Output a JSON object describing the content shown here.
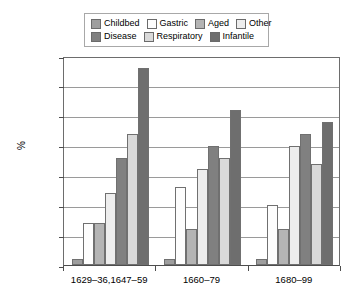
{
  "legend": {
    "rows": [
      [
        {
          "label": "Childbed",
          "color": "#9e9e9e"
        },
        {
          "label": "Gastric",
          "color": "#fdfdfd"
        },
        {
          "label": "Aged",
          "color": "#b4b4b4"
        },
        {
          "label": "Other",
          "color": "#ededed"
        }
      ],
      [
        {
          "label": "Disease",
          "color": "#808080"
        },
        {
          "label": "Respiratory",
          "color": "#d9d9d9"
        },
        {
          "label": "Infantile",
          "color": "#6e6e6e"
        }
      ]
    ]
  },
  "chart_data": {
    "type": "bar",
    "title": "",
    "xlabel": "",
    "ylabel": "%",
    "ylim": [
      0,
      35
    ],
    "yticks": [
      0,
      5,
      10,
      15,
      20,
      25,
      30,
      35
    ],
    "grid": true,
    "legend_position": "top",
    "categories": [
      "1629–36,1647–59",
      "1660–79",
      "1680–99"
    ],
    "series": [
      {
        "name": "Childbed",
        "color": "#9e9e9e",
        "values": [
          1,
          1,
          1
        ]
      },
      {
        "name": "Gastric",
        "color": "#fdfdfd",
        "values": [
          7,
          13,
          10
        ]
      },
      {
        "name": "Aged",
        "color": "#b4b4b4",
        "values": [
          7,
          6,
          6
        ]
      },
      {
        "name": "Other",
        "color": "#ededed",
        "values": [
          12,
          16,
          20
        ]
      },
      {
        "name": "Disease",
        "color": "#808080",
        "values": [
          18,
          20,
          22
        ]
      },
      {
        "name": "Respiratory",
        "color": "#d9d9d9",
        "values": [
          22,
          18,
          17
        ]
      },
      {
        "name": "Infantile",
        "color": "#6e6e6e",
        "values": [
          33,
          26,
          24
        ]
      }
    ]
  }
}
